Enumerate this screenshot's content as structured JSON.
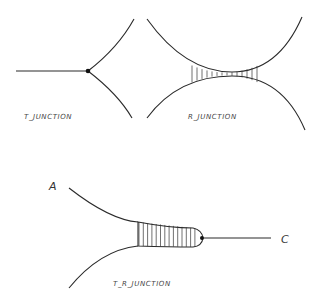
{
  "diagrams": {
    "t_junction": {
      "label": "T_JUNCTION"
    },
    "r_junction": {
      "label": "R_JUNCTION"
    },
    "tr_junction": {
      "label": "T_R_JUNCTION",
      "point_a": "A",
      "point_c": "C"
    }
  }
}
